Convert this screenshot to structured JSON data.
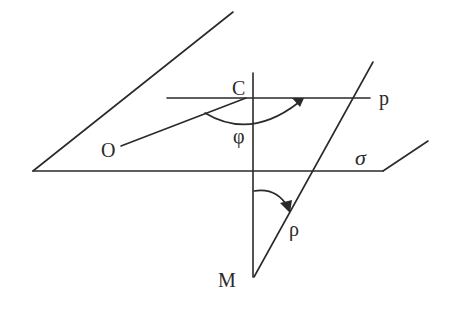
{
  "diagram": {
    "type": "geometry",
    "labels": {
      "origin": "O",
      "center": "C",
      "line_p": "p",
      "angle_phi": "φ",
      "angle_rho": "ρ",
      "point_m": "M",
      "plane": "σ"
    },
    "colors": {
      "stroke": "#2a2a2a",
      "background": "#ffffff"
    }
  }
}
